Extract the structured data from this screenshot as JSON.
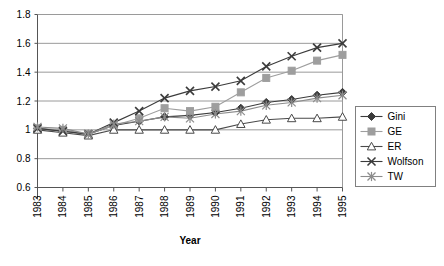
{
  "chart_data": {
    "type": "line",
    "title": "",
    "xlabel": "Year",
    "ylabel": "",
    "categories": [
      "1983",
      "1984",
      "1985",
      "1986",
      "1987",
      "1988",
      "1989",
      "1990",
      "1991",
      "1992",
      "1993",
      "1994",
      "1995"
    ],
    "ylim": [
      0.6,
      1.8
    ],
    "yticks": [
      "0.6",
      "0.8",
      "1",
      "1.2",
      "1.4",
      "1.6",
      "1.8"
    ],
    "ytick_values": [
      0.6,
      0.8,
      1.0,
      1.2,
      1.4,
      1.6,
      1.8
    ],
    "grid": "horizontal",
    "legend_position": "right",
    "series": [
      {
        "name": "Gini",
        "marker": "filled-diamond",
        "color": "#3b3b3b",
        "values": [
          1.01,
          0.99,
          0.97,
          1.03,
          1.06,
          1.09,
          1.1,
          1.12,
          1.15,
          1.19,
          1.21,
          1.24,
          1.26
        ]
      },
      {
        "name": "GE",
        "marker": "filled-square",
        "color": "#9e9e9e",
        "values": [
          1.01,
          1.0,
          0.97,
          1.03,
          1.08,
          1.15,
          1.13,
          1.16,
          1.26,
          1.36,
          1.41,
          1.48,
          1.52
        ]
      },
      {
        "name": "ER",
        "marker": "hollow-triangle",
        "color": "#4a4a4a",
        "values": [
          1.0,
          0.98,
          0.96,
          1.0,
          1.0,
          1.0,
          1.0,
          1.0,
          1.04,
          1.07,
          1.08,
          1.08,
          1.09
        ]
      },
      {
        "name": "Wolfson",
        "marker": "cross-x",
        "color": "#3b3b3b",
        "values": [
          1.01,
          0.99,
          0.97,
          1.05,
          1.13,
          1.22,
          1.27,
          1.3,
          1.34,
          1.44,
          1.51,
          1.57,
          1.6
        ]
      },
      {
        "name": "TW",
        "marker": "asterisk",
        "color": "#8c8c8c",
        "values": [
          1.02,
          1.01,
          0.97,
          1.04,
          1.06,
          1.09,
          1.08,
          1.11,
          1.13,
          1.17,
          1.19,
          1.22,
          1.24
        ]
      }
    ]
  },
  "legend": {
    "items": [
      {
        "label": "Gini"
      },
      {
        "label": "GE"
      },
      {
        "label": "ER"
      },
      {
        "label": "Wolfson"
      },
      {
        "label": "TW"
      }
    ]
  }
}
